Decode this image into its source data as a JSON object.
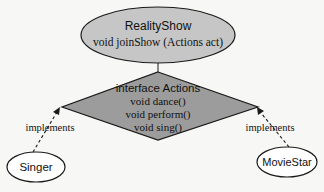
{
  "diagram": {
    "colors": {
      "background": "#f7f7f5",
      "class_fill": "#c6c6c6",
      "interface_fill": "#9c9c9c",
      "impl_fill": "#ffffff",
      "stroke": "#1a1a1a"
    },
    "reality_show": {
      "title": "RealityShow",
      "method": "void joinShow (Actions act)"
    },
    "actions_interface": {
      "title": "interface Actions",
      "methods": [
        "void dance()",
        "void perform()",
        "void sing()"
      ]
    },
    "singer": {
      "label": "Singer"
    },
    "movie_star": {
      "label": "MovieStar"
    },
    "edges": {
      "singer_label": "implements",
      "movie_star_label": "implements"
    }
  }
}
